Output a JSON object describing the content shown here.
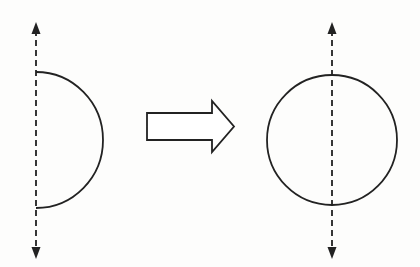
{
  "diagram": {
    "title": "",
    "panels": [
      {
        "id": "before",
        "shape": "semicircle",
        "axis": "dashed vertical line with arrowheads at both ends",
        "curve_side": "right"
      },
      {
        "id": "transform",
        "shape": "block-arrow",
        "direction": "right"
      },
      {
        "id": "after",
        "shape": "circle",
        "axis": "dashed vertical line through center with arrowheads at both ends"
      }
    ],
    "colors": {
      "stroke": "#222222",
      "background": "#fdfdfc",
      "arrow_fill": "#ffffff"
    }
  }
}
